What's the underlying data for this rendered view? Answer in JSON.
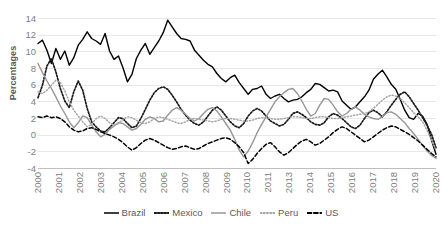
{
  "chart_data": {
    "type": "line",
    "title": "",
    "xlabel": "",
    "ylabel": "Percentages",
    "ylim": [
      -4,
      14
    ],
    "y_ticks": [
      14,
      12,
      10,
      8,
      6,
      4,
      2,
      0,
      -2,
      -4
    ],
    "x_tick_labels": [
      "2000",
      "2001",
      "2002",
      "2003",
      "2004",
      "2005",
      "2006",
      "2007",
      "2008",
      "2009",
      "2010",
      "2011",
      "2013",
      "2014",
      "2015",
      "2016",
      "2017",
      "2018",
      "2019",
      "2020"
    ],
    "grid": "horizontal",
    "legend_position": "bottom",
    "series": [
      {
        "name": "Brazil",
        "style": "solid",
        "color": "#000000",
        "values": [
          11.0,
          11.4,
          10.2,
          8.6,
          10.4,
          9.1,
          10.1,
          8.4,
          9.3,
          10.8,
          11.5,
          12.4,
          11.6,
          11.3,
          10.9,
          12.2,
          10.1,
          9.1,
          9.5,
          8.1,
          6.4,
          7.3,
          9.2,
          10.2,
          11.0,
          9.7,
          10.5,
          11.3,
          12.3,
          13.8,
          13.0,
          12.2,
          11.6,
          11.5,
          11.3,
          10.2,
          9.6,
          9.0,
          8.5,
          8.2,
          7.4,
          6.8,
          6.4,
          6.9,
          7.2,
          6.3,
          5.6,
          4.9,
          5.5,
          5.6,
          5.9,
          4.9,
          4.4,
          4.7,
          4.9,
          4.4,
          4.0,
          4.2,
          4.3,
          4.6,
          5.1,
          5.5,
          6.2,
          6.1,
          5.7,
          5.3,
          5.4,
          5.2,
          4.1,
          3.6,
          3.1,
          3.4,
          4.0,
          4.6,
          5.4,
          6.7,
          7.3,
          7.8,
          7.0,
          6.1,
          5.5,
          4.3,
          3.0,
          2.1,
          1.9,
          2.6,
          2.3,
          1.3,
          -0.6,
          -2.3
        ]
      },
      {
        "name": "Mexico",
        "style": "dotted",
        "color": "#1a1a1a",
        "values": [
          4.5,
          6.0,
          8.3,
          9.2,
          7.6,
          5.6,
          4.1,
          3.3,
          5.2,
          6.5,
          5.4,
          3.2,
          1.6,
          1.0,
          0.5,
          0.4,
          0.9,
          1.5,
          2.1,
          2.0,
          1.4,
          0.9,
          1.1,
          2.0,
          3.1,
          4.2,
          5.1,
          5.6,
          5.8,
          5.5,
          4.8,
          4.0,
          3.1,
          2.4,
          1.8,
          1.4,
          1.2,
          1.6,
          2.3,
          3.0,
          3.4,
          3.0,
          2.3,
          1.6,
          1.1,
          0.9,
          1.4,
          2.3,
          2.9,
          3.2,
          2.9,
          2.3,
          1.7,
          1.4,
          1.1,
          1.3,
          1.9,
          2.6,
          2.8,
          2.5,
          2.1,
          1.6,
          1.3,
          1.2,
          1.5,
          2.2,
          2.6,
          2.4,
          2.0,
          1.5,
          1.0,
          0.8,
          1.2,
          2.0,
          2.7,
          3.0,
          2.7,
          2.2,
          2.8,
          3.6,
          4.3,
          4.9,
          5.2,
          4.6,
          3.8,
          3.0,
          2.1,
          1.2,
          0.1,
          -1.5
        ]
      },
      {
        "name": "Chile",
        "style": "solid",
        "color": "#969696",
        "values": [
          8.6,
          7.5,
          6.5,
          5.6,
          4.6,
          3.5,
          2.6,
          1.6,
          0.9,
          1.5,
          2.3,
          2.1,
          1.2,
          0.4,
          -0.2,
          0.1,
          0.7,
          1.1,
          1.5,
          1.4,
          1.0,
          0.6,
          0.8,
          1.3,
          1.9,
          2.2,
          2.0,
          1.6,
          1.7,
          2.4,
          3.0,
          3.3,
          3.0,
          2.5,
          2.0,
          1.7,
          2.0,
          2.6,
          3.1,
          3.3,
          2.9,
          2.2,
          1.4,
          0.6,
          -0.5,
          -1.8,
          -2.6,
          -1.9,
          -0.9,
          0.3,
          1.3,
          2.2,
          3.1,
          4.0,
          4.6,
          5.1,
          5.5,
          5.6,
          5.0,
          4.1,
          3.1,
          2.3,
          2.6,
          3.6,
          4.4,
          4.3,
          3.6,
          2.8,
          2.3,
          2.6,
          3.1,
          3.4,
          3.0,
          2.5,
          2.2,
          2.0,
          1.9,
          2.2,
          2.7,
          2.8,
          2.5,
          2.0,
          1.5,
          0.8,
          0.2,
          -0.5,
          -1.2,
          -1.9,
          -2.4,
          -2.8
        ]
      },
      {
        "name": "Peru",
        "style": "fine-dotted",
        "color": "#a6a6a6",
        "values": [
          5.2,
          5.0,
          5.4,
          6.0,
          6.6,
          6.3,
          5.3,
          4.0,
          3.0,
          2.3,
          1.6,
          1.0,
          1.3,
          2.0,
          2.3,
          2.0,
          1.5,
          1.2,
          1.4,
          1.9,
          2.2,
          2.1,
          1.8,
          1.5,
          1.4,
          1.6,
          2.0,
          2.2,
          2.1,
          1.9,
          1.7,
          1.5,
          1.4,
          1.6,
          1.9,
          2.0,
          1.9,
          1.8,
          1.7,
          1.6,
          1.7,
          1.9,
          2.0,
          2.0,
          1.9,
          1.8,
          1.7,
          1.7,
          1.8,
          2.0,
          2.1,
          2.1,
          2.0,
          1.9,
          1.9,
          2.0,
          2.1,
          2.2,
          2.2,
          2.1,
          2.0,
          2.0,
          2.1,
          2.2,
          2.2,
          2.1,
          2.0,
          2.0,
          2.1,
          2.2,
          2.3,
          2.4,
          2.5,
          2.6,
          2.8,
          3.2,
          3.7,
          4.2,
          4.6,
          4.8,
          4.7,
          4.4,
          3.9,
          3.3,
          2.7,
          2.2,
          1.6,
          0.6,
          -0.6,
          -1.8
        ]
      },
      {
        "name": "US",
        "style": "dashed",
        "color": "#000000",
        "values": [
          2.2,
          2.1,
          2.3,
          2.1,
          2.2,
          2.0,
          1.6,
          1.0,
          0.6,
          0.4,
          0.5,
          0.8,
          0.9,
          0.7,
          0.4,
          0.2,
          0.0,
          -0.2,
          -0.5,
          -0.9,
          -1.4,
          -1.8,
          -1.5,
          -1.0,
          -0.6,
          -0.4,
          -0.6,
          -0.9,
          -1.2,
          -1.5,
          -1.7,
          -1.6,
          -1.4,
          -1.3,
          -1.5,
          -1.7,
          -1.6,
          -1.3,
          -1.0,
          -0.8,
          -0.6,
          -0.4,
          -0.3,
          -0.5,
          -0.9,
          -1.4,
          -2.1,
          -3.4,
          -2.9,
          -2.2,
          -1.6,
          -1.1,
          -0.9,
          -1.4,
          -2.0,
          -2.4,
          -2.1,
          -1.6,
          -1.1,
          -0.7,
          -0.5,
          -0.8,
          -1.2,
          -1.0,
          -0.6,
          -0.2,
          0.3,
          0.7,
          1.0,
          0.8,
          0.4,
          0.0,
          -0.4,
          -0.8,
          -0.6,
          -0.2,
          0.2,
          0.6,
          0.9,
          1.1,
          1.0,
          0.7,
          0.4,
          0.1,
          -0.3,
          -0.7,
          -1.2,
          -1.7,
          -2.2,
          -2.6
        ]
      }
    ]
  },
  "legend": {
    "items": [
      {
        "label": "Brazil"
      },
      {
        "label": "Mexico"
      },
      {
        "label": "Chile"
      },
      {
        "label": "Peru"
      },
      {
        "label": "US"
      }
    ]
  },
  "axis": {
    "y_title": "Percentages"
  }
}
